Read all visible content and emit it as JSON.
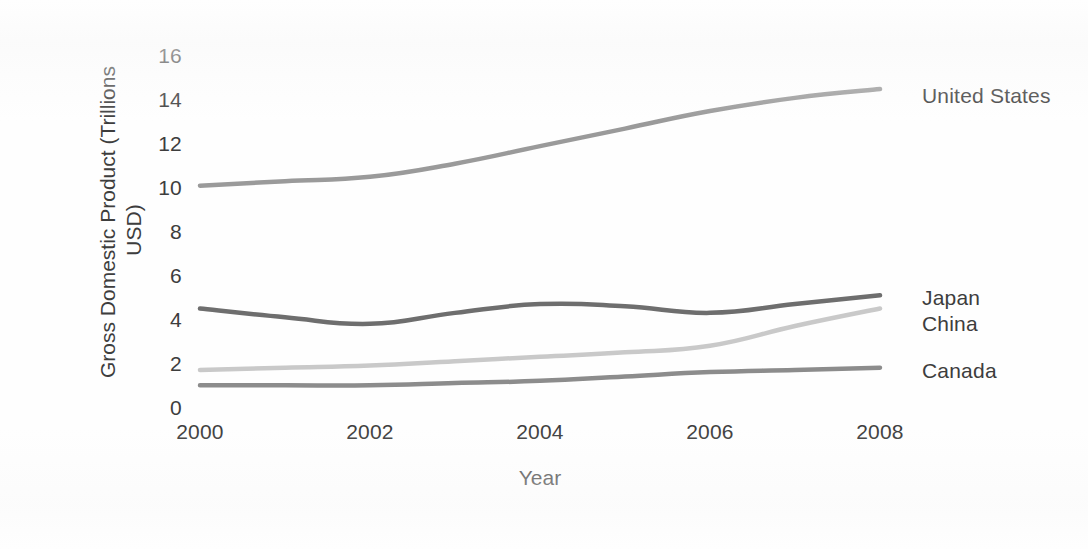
{
  "chart_data": {
    "type": "line",
    "title": "",
    "xlabel": "Year",
    "ylabel": "Gross Domestic Product (Trillions USD)",
    "ylabel_line1": "Gross Domestic Product (Trillions",
    "ylabel_line2": "USD)",
    "x": [
      2000,
      2001,
      2002,
      2003,
      2004,
      2005,
      2006,
      2007,
      2008
    ],
    "xtick_labels": [
      "2000",
      "2002",
      "2004",
      "2006",
      "2008"
    ],
    "xticks": [
      2000,
      2002,
      2004,
      2006,
      2008
    ],
    "ytick_labels": [
      "0",
      "2",
      "4",
      "6",
      "8",
      "10",
      "12",
      "14",
      "16"
    ],
    "yticks": [
      0,
      2,
      4,
      6,
      8,
      10,
      12,
      14,
      16
    ],
    "xlim": [
      2000,
      2008
    ],
    "ylim": [
      0,
      16
    ],
    "grid": false,
    "legend_position": "right-inline-end-of-line",
    "series": [
      {
        "name": "United States",
        "color": "#9a9a9a",
        "values": [
          10.0,
          10.2,
          10.4,
          11.0,
          11.8,
          12.6,
          13.4,
          14.0,
          14.4
        ]
      },
      {
        "name": "Japan",
        "color": "#6e6e6e",
        "values": [
          4.4,
          4.0,
          3.7,
          4.2,
          4.6,
          4.5,
          4.2,
          4.6,
          5.0
        ]
      },
      {
        "name": "China",
        "color": "#c9c9c9",
        "values": [
          1.6,
          1.7,
          1.8,
          2.0,
          2.2,
          2.4,
          2.7,
          3.6,
          4.4
        ]
      },
      {
        "name": "Canada",
        "color": "#8c8c8c",
        "values": [
          0.9,
          0.9,
          0.9,
          1.0,
          1.1,
          1.3,
          1.5,
          1.6,
          1.7
        ]
      }
    ]
  },
  "labels": {
    "united_states": "United States",
    "japan": "Japan",
    "china": "China",
    "canada": "Canada"
  }
}
